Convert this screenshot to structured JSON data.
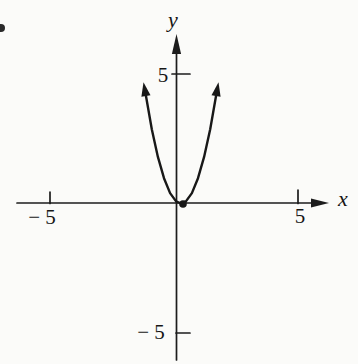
{
  "figure": {
    "type": "textbook-coordinate-plane-figure",
    "ink_color": "#1a1a1a",
    "paper_color": "#fbfbf9",
    "marks": [
      "cropped-problem-number-dot-at-left-edge",
      "solid-dot-at-parabola-vertex"
    ]
  },
  "chart_data": {
    "type": "line",
    "title": "",
    "xlabel": "x",
    "ylabel": "y",
    "xlim": [
      -6.5,
      6.5
    ],
    "ylim": [
      -6.5,
      6.5
    ],
    "grid": false,
    "legend": false,
    "x_ticks": [
      {
        "value": -5,
        "label": "− 5"
      },
      {
        "value": 5,
        "label": "5"
      }
    ],
    "y_ticks": [
      {
        "value": -5,
        "label": "− 5"
      },
      {
        "value": 5,
        "label": "5"
      }
    ],
    "series": [
      {
        "name": "parabola",
        "description": "narrow upward-opening parabola (approximately y = 2x²) with vertex at the origin; both branches end in arrowheads",
        "points": [
          [
            -1.45,
            4.205
          ],
          [
            -1.2,
            2.88
          ],
          [
            -0.95,
            1.805
          ],
          [
            -0.7,
            0.98
          ],
          [
            -0.45,
            0.405
          ],
          [
            -0.2,
            0.08
          ],
          [
            0,
            0
          ],
          [
            0.2,
            0.08
          ],
          [
            0.45,
            0.405
          ],
          [
            0.7,
            0.98
          ],
          [
            0.95,
            1.805
          ],
          [
            1.2,
            2.88
          ],
          [
            1.45,
            4.205
          ]
        ]
      }
    ],
    "annotations": [
      {
        "type": "point",
        "at": [
          0,
          0
        ],
        "style": "solid dot",
        "label": ""
      }
    ]
  }
}
